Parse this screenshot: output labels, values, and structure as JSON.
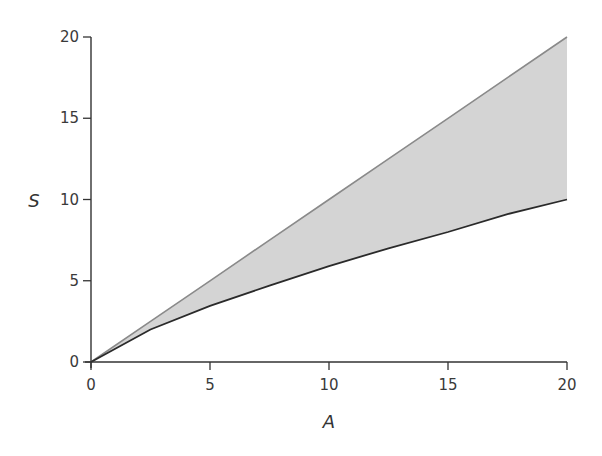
{
  "chart_data": {
    "type": "area",
    "title": "",
    "xlabel": "A",
    "ylabel": "S",
    "xlim": [
      0,
      20
    ],
    "ylim": [
      0,
      20
    ],
    "xticks": [
      0,
      5,
      10,
      15,
      20
    ],
    "yticks": [
      0,
      5,
      10,
      15,
      20
    ],
    "grid": false,
    "legend": null,
    "x": [
      0,
      2.5,
      5,
      7.5,
      10,
      12.5,
      15,
      17.5,
      20
    ],
    "series": [
      {
        "name": "upper bound (S = A)",
        "values": [
          0,
          2.5,
          5,
          7.5,
          10,
          12.5,
          15,
          17.5,
          20
        ],
        "color": "#8a8a8a"
      },
      {
        "name": "lower bound",
        "values": [
          0,
          2.0,
          3.45,
          4.7,
          5.9,
          7.0,
          8.0,
          9.1,
          10.0
        ],
        "color": "#2a2a2a"
      }
    ],
    "fill_between": {
      "upper": 0,
      "lower": 1,
      "color": "#d4d4d4"
    }
  }
}
